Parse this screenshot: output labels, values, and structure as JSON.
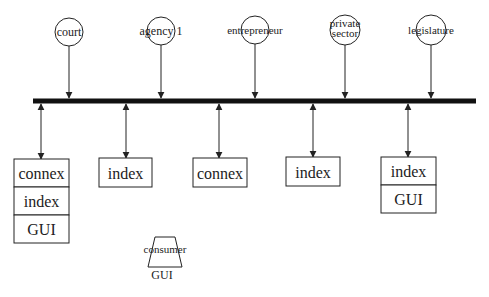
{
  "diagram": {
    "bus": {
      "x1": 33,
      "x2": 476,
      "y": 101,
      "thickness": 5
    },
    "producers": [
      {
        "label": "court",
        "cx": 69,
        "cy": 32,
        "r": 14,
        "font": 12
      },
      {
        "label": "agency 1",
        "cx": 161,
        "cy": 31,
        "r": 14,
        "font": 12
      },
      {
        "label": "entrepreneur",
        "cx": 255,
        "cy": 30,
        "r": 14,
        "font": 11
      },
      {
        "label_lines": [
          "private",
          "sector"
        ],
        "cx": 345,
        "cy": 30,
        "r": 15,
        "font": 11
      },
      {
        "label": "legislature",
        "cx": 431,
        "cy": 30,
        "r": 15,
        "font": 11
      }
    ],
    "nodes": [
      {
        "x": 14,
        "y": 159,
        "w": 55,
        "row_h": 28,
        "anchor_x": 41,
        "rows": [
          "connex",
          "index",
          "GUI"
        ]
      },
      {
        "x": 99,
        "y": 158,
        "w": 53,
        "row_h": 29,
        "anchor_x": 126,
        "rows": [
          "index"
        ]
      },
      {
        "x": 193,
        "y": 158,
        "w": 54,
        "row_h": 29,
        "anchor_x": 219,
        "rows": [
          "connex"
        ]
      },
      {
        "x": 286,
        "y": 157,
        "w": 54,
        "row_h": 29,
        "anchor_x": 313,
        "rows": [
          "index"
        ]
      },
      {
        "x": 381,
        "y": 157,
        "w": 55,
        "row_h": 28,
        "anchor_x": 408,
        "rows": [
          "index",
          "GUI"
        ]
      }
    ],
    "consumer": {
      "label": "consumer",
      "sub_label": "GUI",
      "cx": 165,
      "top_y": 237,
      "bottom_y": 267
    },
    "colors": {
      "line": "#222222",
      "bus": "#111111",
      "text": "#222222"
    }
  }
}
